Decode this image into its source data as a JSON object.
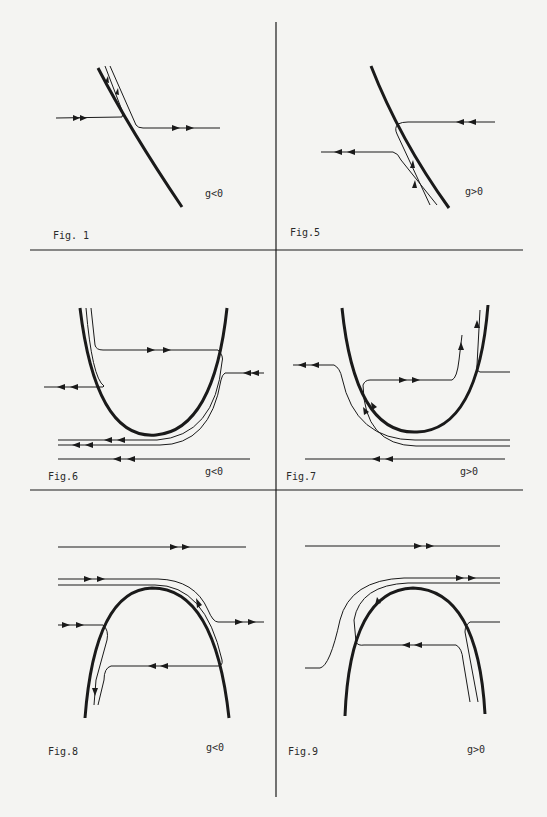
{
  "page": {
    "colors": {
      "ink": "#1a1a1a",
      "paper": "#f4f4f2"
    }
  },
  "figures": [
    {
      "id": "fig1",
      "caption": "Fig. 1",
      "condition": "g<0",
      "boundary_shape": "diagonal line (descending right)"
    },
    {
      "id": "fig5",
      "caption": "Fig.5",
      "condition": "g>0",
      "boundary_shape": "diagonal line (descending right)"
    },
    {
      "id": "fig6",
      "caption": "Fig.6",
      "condition": "g<0",
      "boundary_shape": "U-shaped parabola (opening up)"
    },
    {
      "id": "fig7",
      "caption": "Fig.7",
      "condition": "g>0",
      "boundary_shape": "U-shaped parabola (opening up)"
    },
    {
      "id": "fig8",
      "caption": "Fig.8",
      "condition": "g<0",
      "boundary_shape": "arch (opening down)"
    },
    {
      "id": "fig9",
      "caption": "Fig.9",
      "condition": "g>0",
      "boundary_shape": "arch (opening down)"
    }
  ]
}
